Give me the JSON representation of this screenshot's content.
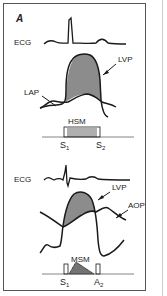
{
  "figure": {
    "panel_label": "A",
    "top": {
      "ecg_label": "ECG",
      "lvp_label": "LVP",
      "lap_label": "LAP",
      "murmur_label": "HSM",
      "s1_label": "S",
      "s1_sub": "1",
      "s2_label": "S",
      "s2_sub": "2"
    },
    "bottom": {
      "ecg_label": "ECG",
      "lvp_label": "LVP",
      "aop_label": "AOP",
      "murmur_label": "MSM",
      "s1_label": "S",
      "s1_sub": "1",
      "a2_label": "A",
      "a2_sub": "2"
    },
    "colors": {
      "line": "#1a1a1a",
      "shade": "#8c8c8c",
      "border": "#555555"
    }
  }
}
